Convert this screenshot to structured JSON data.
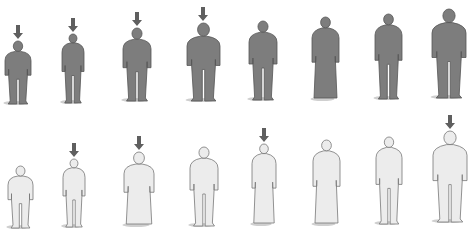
{
  "title": "",
  "colors": {
    "dark_fill": "#7d7d7d",
    "dark_stroke": "#555555",
    "light_fill": "#ececec",
    "light_stroke": "#777777",
    "arrow": "#5f5f5f",
    "shadow": "#cfcfcf"
  },
  "rows": [
    {
      "name": "top-row-dark",
      "figures": [
        {
          "x": 18,
          "w": 26,
          "top": 40,
          "bottom": 104,
          "type": "man-small",
          "arrow": true
        },
        {
          "x": 73,
          "w": 22,
          "top": 33,
          "bottom": 103,
          "type": "woman-short-hair",
          "arrow": true
        },
        {
          "x": 137,
          "w": 28,
          "top": 27,
          "bottom": 101,
          "type": "man",
          "arrow": true
        },
        {
          "x": 203,
          "w": 33,
          "top": 22,
          "bottom": 101,
          "type": "man-large",
          "arrow": true
        },
        {
          "x": 263,
          "w": 28,
          "top": 20,
          "bottom": 100,
          "type": "woman-long-hair",
          "arrow": false
        },
        {
          "x": 325,
          "w": 27,
          "top": 16,
          "bottom": 100,
          "type": "woman-dress",
          "arrow": false
        },
        {
          "x": 388,
          "w": 27,
          "top": 13,
          "bottom": 99,
          "type": "woman",
          "arrow": false
        },
        {
          "x": 449,
          "w": 34,
          "top": 8,
          "bottom": 98,
          "type": "man-large",
          "arrow": false
        }
      ]
    },
    {
      "name": "bottom-row-light",
      "figures": [
        {
          "x": 20,
          "w": 25,
          "top": 165,
          "bottom": 228,
          "type": "child-chubby",
          "arrow": false
        },
        {
          "x": 74,
          "w": 22,
          "top": 158,
          "bottom": 227,
          "type": "woman-slim",
          "arrow": true
        },
        {
          "x": 139,
          "w": 30,
          "top": 151,
          "bottom": 226,
          "type": "figure-wide",
          "arrow": true
        },
        {
          "x": 204,
          "w": 28,
          "top": 146,
          "bottom": 226,
          "type": "man-spiky-hair",
          "arrow": false
        },
        {
          "x": 264,
          "w": 24,
          "top": 143,
          "bottom": 225,
          "type": "woman-robe",
          "arrow": true
        },
        {
          "x": 326,
          "w": 27,
          "top": 139,
          "bottom": 225,
          "type": "woman-elderly",
          "arrow": false
        },
        {
          "x": 389,
          "w": 26,
          "top": 136,
          "bottom": 224,
          "type": "woman-pigtails",
          "arrow": false
        },
        {
          "x": 450,
          "w": 34,
          "top": 130,
          "bottom": 222,
          "type": "man-large",
          "arrow": true
        }
      ]
    }
  ]
}
